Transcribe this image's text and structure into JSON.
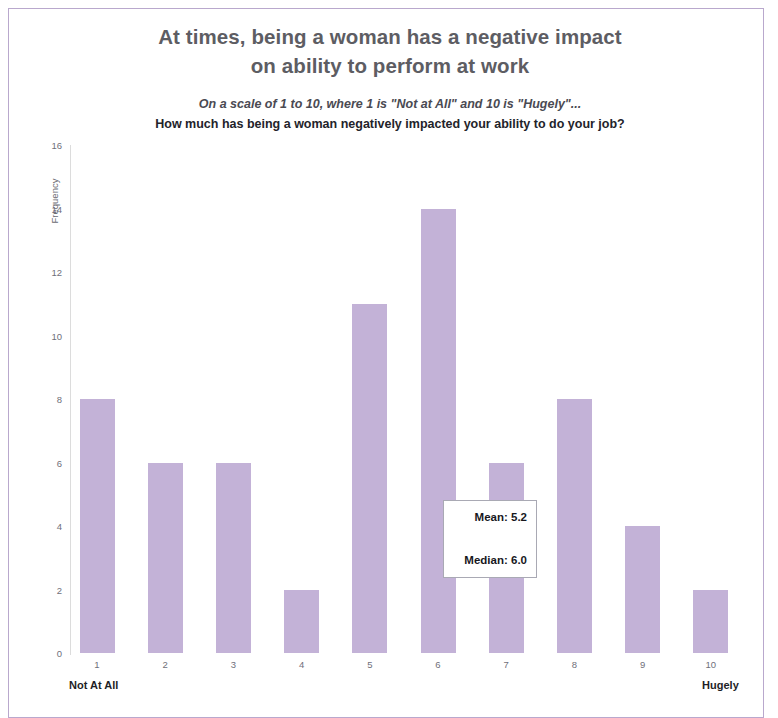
{
  "page": {
    "frame_color": "#b9a8cd",
    "background": "#ffffff"
  },
  "header": {
    "title_line_1": "At times, being a woman has a negative impact",
    "title_line_2": "on ability to perform at work",
    "subtitle_line_1": "On a scale of 1 to 10, where 1 is \"Not at All\" and 10 is \"Hugely\"...",
    "subtitle_line_2": "How much has being a woman negatively impacted your ability to do your job?"
  },
  "annotation": {
    "mean_label": "Mean: 5.2",
    "median_label": "Median: 6.0"
  },
  "axis": {
    "y_title": "Frequency",
    "y_ticks": [
      "0",
      "2",
      "4",
      "6",
      "8",
      "10",
      "12",
      "14",
      "16"
    ],
    "x_low_anchor": "Not At All",
    "x_high_anchor": "Hugely"
  },
  "chart_data": {
    "type": "bar",
    "title": "At times, being a woman has a negative impact on ability to perform at work",
    "subtitle": "On a scale of 1 to 10, where 1 is \"Not at All\" and 10 is \"Hugely\"... How much has being a woman negatively impacted your ability to do your job?",
    "xlabel": "",
    "ylabel": "Frequency",
    "categories": [
      "1",
      "2",
      "3",
      "4",
      "5",
      "6",
      "7",
      "8",
      "9",
      "10"
    ],
    "values": [
      8,
      6,
      6,
      2,
      11,
      14,
      6,
      8,
      4,
      2
    ],
    "ylim": [
      0,
      16
    ],
    "ytick_step": 2,
    "grid": false,
    "legend": null,
    "bar_color": "#c3b2d7",
    "category_anchor_low": "Not At All",
    "category_anchor_high": "Hugely",
    "annotations": {
      "mean": 5.2,
      "median": 6.0
    }
  }
}
